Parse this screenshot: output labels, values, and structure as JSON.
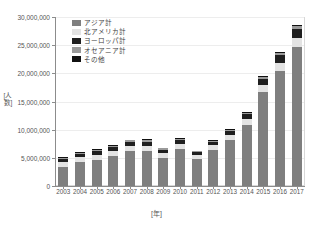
{
  "chart_data": {
    "type": "bar",
    "stacked": true,
    "title": "",
    "xlabel": "[年]",
    "ylabel": "[人数]",
    "ylim": [
      0,
      30000000
    ],
    "ytick_values": [
      0,
      5000000,
      10000000,
      15000000,
      20000000,
      25000000,
      30000000
    ],
    "ytick_labels": [
      "0",
      "5,000,000",
      "10,000,000",
      "15,000,000",
      "20,000,000",
      "25,000,000",
      "30,000,000"
    ],
    "grid": true,
    "legend_position": "upper-left",
    "categories": [
      "2003",
      "2004",
      "2005",
      "2006",
      "2007",
      "2008",
      "2009",
      "2010",
      "2011",
      "2012",
      "2013",
      "2014",
      "2015",
      "2016",
      "2017"
    ],
    "series": [
      {
        "name": "アジア計",
        "color": "#7f7f7f",
        "values": [
          3450000,
          4200000,
          4600000,
          5250000,
          6130000,
          6150000,
          4900000,
          6550000,
          4830000,
          6390000,
          8150000,
          10800000,
          16650000,
          20430000,
          24720000
        ]
      },
      {
        "name": "北アメリカ計",
        "color": "#e3e3e3",
        "values": [
          830000,
          880000,
          920000,
          950000,
          1000000,
          1010000,
          900000,
          930000,
          680000,
          850000,
          940000,
          1110000,
          1300000,
          1450000,
          1600000
        ]
      },
      {
        "name": "ヨーロッパ計",
        "color": "#1f1f1f",
        "values": [
          530000,
          590000,
          640000,
          670000,
          720000,
          740000,
          640000,
          700000,
          450000,
          620000,
          680000,
          830000,
          1100000,
          1340000,
          1520000
        ]
      },
      {
        "name": "オセアニア計",
        "color": "#9a9a9a",
        "values": [
          200000,
          210000,
          220000,
          230000,
          250000,
          250000,
          230000,
          240000,
          170000,
          210000,
          230000,
          270000,
          340000,
          420000,
          480000
        ]
      },
      {
        "name": "その他",
        "color": "#111111",
        "values": [
          90000,
          100000,
          110000,
          120000,
          130000,
          130000,
          120000,
          130000,
          90000,
          110000,
          130000,
          160000,
          190000,
          230000,
          270000
        ]
      }
    ],
    "totals": [
      5100000,
      5980000,
      6490000,
      7220000,
      8230000,
      8280000,
      6790000,
      8550000,
      6220000,
      8180000,
      10130000,
      13170000,
      19580000,
      23870000,
      28590000
    ]
  }
}
